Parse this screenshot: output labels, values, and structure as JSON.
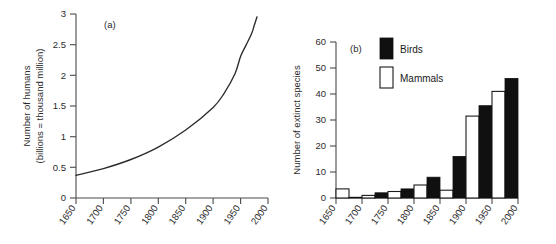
{
  "figure": {
    "panel_a_label": "(a)",
    "panel_b_label": "(b)"
  },
  "chart_data": [
    {
      "id": "panel-a",
      "type": "line",
      "title": "",
      "panel_label": "(a)",
      "xlabel": "",
      "ylabel": "Number of humans (billions = thousand million)",
      "ylabel_line1": "Number of humans",
      "ylabel_line2": "(billions = thousand million)",
      "xlim": [
        1650,
        2000
      ],
      "ylim": [
        0,
        3.25
      ],
      "grid": false,
      "legend": "none",
      "xticks": [
        1650,
        1700,
        1750,
        1800,
        1850,
        1900,
        1950,
        2000
      ],
      "xtick_labels": [
        "1650",
        "1700",
        "1750",
        "1800",
        "1850",
        "1900",
        "1950",
        "2000"
      ],
      "yticks": [
        0,
        0.5,
        1,
        1.5,
        2,
        2.5,
        3
      ],
      "ytick_labels": [
        "0",
        "0.5",
        "1",
        "1.5",
        "2",
        "2.5",
        "3"
      ],
      "series": [
        {
          "name": "World human population",
          "x": [
            1650,
            1700,
            1750,
            1800,
            1850,
            1900,
            1920,
            1940,
            1950,
            1960,
            1970,
            1975,
            1980
          ],
          "y": [
            0.4,
            0.52,
            0.68,
            0.9,
            1.2,
            1.6,
            1.85,
            2.2,
            2.5,
            2.7,
            2.9,
            3.05,
            3.2
          ]
        }
      ]
    },
    {
      "id": "panel-b",
      "type": "bar",
      "title": "",
      "panel_label": "(b)",
      "xlabel": "",
      "ylabel": "Number of extinct species",
      "xlim": [
        1650,
        2000
      ],
      "ylim": [
        0,
        60
      ],
      "grid": false,
      "legend": "inside-top-left",
      "xticks": [
        1650,
        1700,
        1750,
        1800,
        1850,
        1900,
        1950,
        2000
      ],
      "xtick_labels": [
        "1650",
        "1700",
        "1750",
        "1800",
        "1850",
        "1900",
        "1950",
        "2000"
      ],
      "yticks": [
        0,
        10,
        20,
        30,
        40,
        50,
        60
      ],
      "ytick_labels": [
        "0",
        "10",
        "20",
        "30",
        "40",
        "50",
        "60"
      ],
      "categories": [
        "1650-1700",
        "1700-1750",
        "1750-1800",
        "1800-1850",
        "1850-1900",
        "1900-1950",
        "1950-2000"
      ],
      "series": [
        {
          "name": "Mammals",
          "color": "#ffffff",
          "values": [
            3.5,
            1,
            2.5,
            5,
            3,
            31.5,
            41
          ]
        },
        {
          "name": "Birds",
          "color": "#101010",
          "values": [
            0.3,
            2,
            3.5,
            8,
            16,
            35.5,
            46
          ]
        }
      ],
      "legend_entries": [
        {
          "label": "Birds",
          "swatch": "filled-black"
        },
        {
          "label": "Mammals",
          "swatch": "open-white"
        }
      ]
    }
  ]
}
